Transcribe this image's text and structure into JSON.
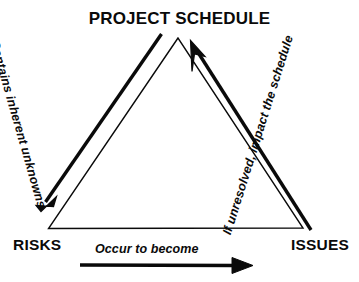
{
  "diagram": {
    "nodes": {
      "apex": "PROJECT SCHEDULE",
      "bottom_left": "RISKS",
      "bottom_right": "ISSUES"
    },
    "edges": {
      "left": {
        "label": "Contains inherent unknowns",
        "from": "PROJECT SCHEDULE",
        "to": "RISKS",
        "direction": "down-left"
      },
      "right": {
        "label": "If unresolved, impact the schedule",
        "from": "ISSUES",
        "to": "PROJECT SCHEDULE",
        "direction": "up-left"
      },
      "bottom": {
        "label": "Occur to become",
        "from": "RISKS",
        "to": "ISSUES",
        "direction": "right"
      }
    },
    "colors": {
      "ink": "#0a0a0a",
      "background": "#ffffff"
    }
  }
}
